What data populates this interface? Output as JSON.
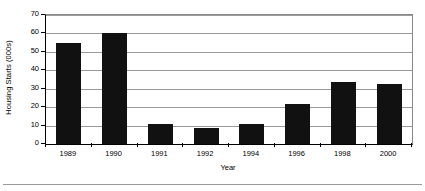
{
  "chart_data": {
    "type": "bar",
    "title": "",
    "subtitle": "",
    "xlabel": "Year",
    "ylabel": "Housing Starts (000s)",
    "categories": [
      "1989",
      "1990",
      "1991",
      "1992",
      "1994",
      "1996",
      "1998",
      "2000"
    ],
    "values": [
      55,
      60.5,
      11,
      8.5,
      11,
      21.5,
      33.5,
      32.5
    ],
    "series": [
      {
        "name": "Housing Starts",
        "values": [
          55,
          60.5,
          11,
          8.5,
          11,
          21.5,
          33.5,
          32.5
        ]
      }
    ],
    "ylim": [
      0,
      70
    ],
    "yticks": [
      0,
      10,
      20,
      30,
      40,
      50,
      60,
      70
    ],
    "ytick_labels": [
      "0",
      "10",
      "20",
      "30",
      "40",
      "50",
      "60",
      "70"
    ],
    "grid": "horizontal",
    "legend": "none",
    "bar_color": "#111111",
    "gridline_color": "#9a9a9a",
    "axis_color": "#000000",
    "background_color": "#ffffff"
  }
}
